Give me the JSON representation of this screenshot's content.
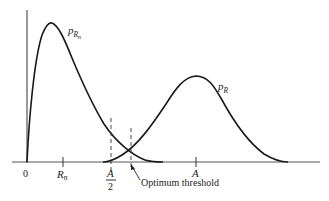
{
  "figure": {
    "curves": [
      {
        "name": "noise-pdf",
        "label_main": "p",
        "label_sub": "R",
        "label_subsub": "n",
        "peak": [
          51,
          23
        ]
      },
      {
        "name": "signal-pdf",
        "label_main": "p",
        "label_sub": "R",
        "peak": [
          197,
          76
        ]
      }
    ],
    "x_ticks": [
      {
        "name": "origin",
        "label": "0",
        "x": 27
      },
      {
        "name": "rn",
        "label_main": "R",
        "label_sub": "n",
        "x": 63
      },
      {
        "name": "a-half",
        "label_num": "A",
        "label_den": "2",
        "x": 111
      },
      {
        "name": "a",
        "label": "A",
        "x": 196
      }
    ],
    "annotation": {
      "text": "Optimum threshold",
      "x": 131
    },
    "colors": {
      "curve": "#1a1a1a",
      "axis": "#555555",
      "background": "#ffffff"
    }
  }
}
